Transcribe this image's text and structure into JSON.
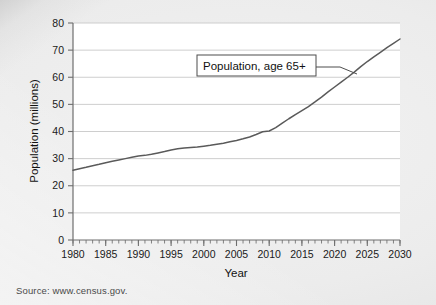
{
  "figure": {
    "source_note": "Source: www.census.gov.",
    "callout_label": "Population, age 65+",
    "colors": {
      "page_background": "#ececec",
      "plot_background": "#ffffff",
      "grid": "#c8c8c8",
      "axis": "#6e6e6e",
      "series_line": "#5a5a5a",
      "text": "#1a1a1a",
      "callout_border": "#4d4d4d"
    }
  },
  "chart_data": {
    "type": "line",
    "title": "",
    "subtitle": "",
    "xlabel": "Year",
    "ylabel": "Population (millions)",
    "xlim": [
      1980,
      2030
    ],
    "ylim": [
      0,
      80
    ],
    "ytick_step": 10,
    "xtick_step": 5,
    "xminor_tick_step": 1,
    "grid": "horizontal",
    "legend": "none",
    "annotations": [
      {
        "text": "Population, age 65+",
        "type": "callout-box",
        "points_to_x": 2023,
        "points_to_y": 63
      }
    ],
    "xticks": [
      1980,
      1985,
      1990,
      1995,
      2000,
      2005,
      2010,
      2015,
      2020,
      2025,
      2030
    ],
    "yticks": [
      0,
      10,
      20,
      30,
      40,
      50,
      60,
      70,
      80
    ],
    "series": [
      {
        "name": "Population, age 65+",
        "x": [
          1980,
          1981,
          1982,
          1983,
          1984,
          1985,
          1986,
          1987,
          1988,
          1989,
          1990,
          1991,
          1992,
          1993,
          1994,
          1995,
          1996,
          1997,
          1998,
          1999,
          2000,
          2001,
          2002,
          2003,
          2004,
          2005,
          2006,
          2007,
          2008,
          2009,
          2010,
          2011,
          2012,
          2013,
          2014,
          2015,
          2016,
          2017,
          2018,
          2019,
          2020,
          2021,
          2022,
          2023,
          2024,
          2025,
          2026,
          2027,
          2028,
          2029,
          2030
        ],
        "values": [
          25.7,
          26.3,
          26.8,
          27.4,
          27.9,
          28.5,
          29.0,
          29.5,
          30.0,
          30.5,
          31.0,
          31.2,
          31.6,
          32.1,
          32.6,
          33.2,
          33.6,
          33.9,
          34.1,
          34.3,
          34.6,
          34.9,
          35.3,
          35.7,
          36.2,
          36.7,
          37.3,
          38.0,
          38.9,
          39.9,
          40.2,
          41.4,
          43.1,
          44.7,
          46.2,
          47.7,
          49.2,
          50.9,
          52.7,
          54.6,
          56.4,
          58.2,
          60.0,
          61.9,
          63.9,
          65.8,
          67.5,
          69.2,
          70.9,
          72.5,
          74.1
        ]
      }
    ]
  }
}
